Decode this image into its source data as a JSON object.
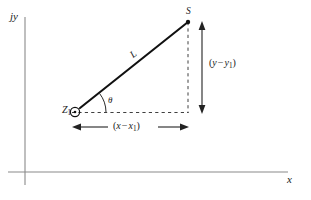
{
  "figure": {
    "type": "geometry-diagram",
    "background_color": "#ffffff",
    "line_color": "#1a1a1a",
    "axis_color": "#8a8a8a"
  },
  "axes": {
    "y_label": "jy",
    "x_label": "x",
    "origin_px": {
      "x": 25,
      "y": 172
    },
    "x_axis_end_px": {
      "x": 288,
      "y": 172
    },
    "y_axis_top_px": {
      "x": 25,
      "y": 17
    }
  },
  "points": {
    "start": {
      "name": "Z",
      "subscript": "1",
      "marker": "circle-dot",
      "px": {
        "x": 75,
        "y": 112
      }
    },
    "end": {
      "name": "S",
      "marker": "filled-dot",
      "px": {
        "x": 188,
        "y": 22
      }
    }
  },
  "labels": {
    "hypotenuse": "L",
    "angle": "θ",
    "vertical_leg": {
      "open": "(",
      "var1": "y",
      "minus": "−",
      "var2": "y",
      "sub": "1",
      "close": ")"
    },
    "horizontal_leg": {
      "open": "(",
      "var1": "x",
      "minus": "−",
      "var2": "x",
      "sub": "1",
      "close": ")"
    }
  },
  "annotations": {
    "vertical_dashed_line": {
      "x": 188,
      "y_top": 22,
      "y_bottom": 112
    },
    "horizontal_dashed_line": {
      "y": 112,
      "x_left": 72,
      "x_right": 188
    },
    "vertical_arrow": {
      "x": 202,
      "y_top": 25,
      "y_bottom": 112
    },
    "horizontal_arrow": {
      "y": 127,
      "x_left": 73,
      "x_right": 188
    },
    "angle_arc_radius": 30
  }
}
